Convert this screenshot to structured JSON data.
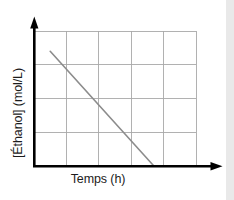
{
  "chart_data": {
    "type": "line",
    "title": "",
    "subtitle": "",
    "xlabel": "Temps (h)",
    "ylabel": "[Éthanol] (mol/L)",
    "xlim": [
      0,
      5
    ],
    "ylim": [
      0,
      4
    ],
    "x_tick_labels": [],
    "y_tick_labels": [],
    "grid": true,
    "grid_columns": 5,
    "grid_rows": 4,
    "grid_color": "#a8a8a8",
    "axis_color": "#000000",
    "background_color": "#ffffff",
    "legend": null,
    "annotations": [],
    "series": [
      {
        "name": "[Éthanol]",
        "color": "#8c8c8c",
        "line_width": 1.6,
        "markers": false,
        "x": [
          0.5,
          3.7
        ],
        "y": [
          3.4,
          0.0
        ],
        "points": [
          {
            "x": 0.5,
            "y": 3.4
          },
          {
            "x": 3.7,
            "y": 0.0
          }
        ]
      }
    ]
  },
  "figure": {
    "x_axis_label": "Temps (h)",
    "y_axis_label": "[Éthanol] (mol/L)",
    "x_axis_arrow": "arrow-right",
    "y_axis_arrow": "arrow-up"
  }
}
